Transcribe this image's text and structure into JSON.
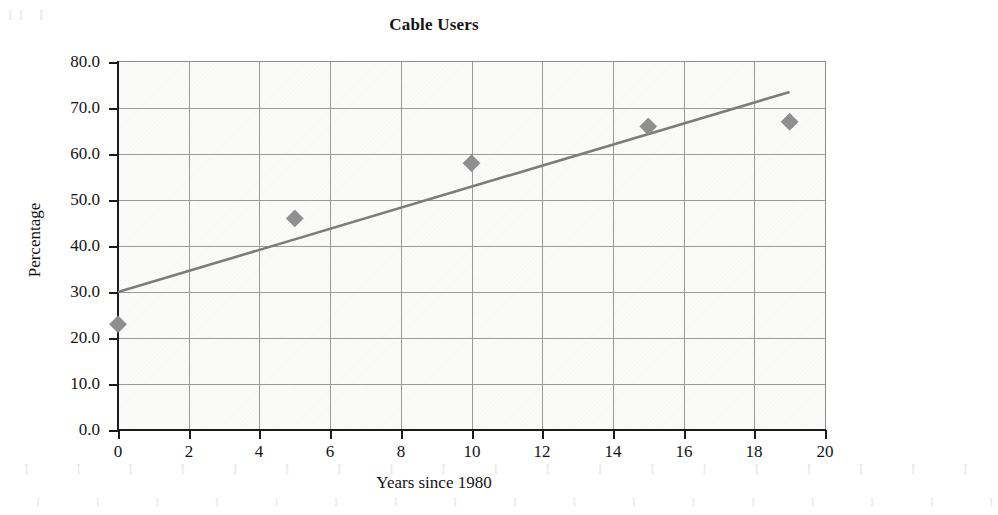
{
  "chart_data": {
    "type": "scatter",
    "title": "Cable Users",
    "xlabel": "Years since 1980",
    "ylabel": "Percentage",
    "xlim": [
      0,
      20
    ],
    "ylim": [
      0,
      80
    ],
    "grid": true,
    "legend": "none",
    "xticks": [
      "0",
      "2",
      "4",
      "6",
      "8",
      "10",
      "12",
      "14",
      "16",
      "18",
      "20"
    ],
    "xtick_values": [
      0,
      2,
      4,
      6,
      8,
      10,
      12,
      14,
      16,
      18,
      20
    ],
    "yticks": [
      "0.0",
      "10.0",
      "20.0",
      "30.0",
      "40.0",
      "50.0",
      "60.0",
      "70.0",
      "80.0"
    ],
    "ytick_values": [
      0,
      10,
      20,
      30,
      40,
      50,
      60,
      70,
      80
    ],
    "series": [
      {
        "name": "Cable Users",
        "marker": "diamond",
        "color": "#8f8f8f",
        "x": [
          0,
          5,
          10,
          15,
          19
        ],
        "y": [
          23,
          46,
          58,
          66,
          67
        ],
        "points": [
          {
            "x": 0,
            "y": 23
          },
          {
            "x": 5,
            "y": 46
          },
          {
            "x": 10,
            "y": 58
          },
          {
            "x": 15,
            "y": 66
          },
          {
            "x": 19,
            "y": 67
          }
        ]
      },
      {
        "name": "trend line",
        "type": "line",
        "color": "#7c7c7c",
        "x": [
          0,
          19
        ],
        "y": [
          30,
          73.5
        ]
      }
    ]
  },
  "figure": {
    "title": "Cable Users",
    "x_axis_title": "Years since 1980",
    "y_axis_title": "Percentage"
  },
  "artifacts": {
    "ghost_top": "ghost bleed-through text",
    "ghost_left": "II",
    "ghost_bottom_1": "ghost bleed-through text",
    "ghost_bottom_2": "ghost bleed-through text"
  }
}
